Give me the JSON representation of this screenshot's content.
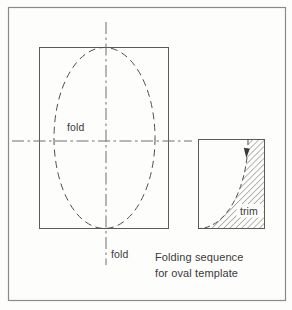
{
  "diagram": {
    "labels": {
      "fold_horizontal": "fold",
      "fold_vertical": "fold",
      "trim": "trim"
    },
    "caption": {
      "line1": "Folding sequence",
      "line2": "for oval template"
    },
    "colors": {
      "ink": "#4d4d4d",
      "centerline": "#6e6e6e",
      "outer_border": "#8a8a8a",
      "background": "#fdfdfc"
    }
  }
}
